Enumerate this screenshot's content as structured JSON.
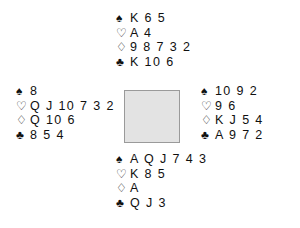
{
  "diagram": {
    "type": "bridge-hand-diagram",
    "suit_symbols": {
      "spade": "♠",
      "heart": "♡",
      "diamond": "♢",
      "club": "♣"
    },
    "colors": {
      "text": "#101010",
      "center_fill": "#e3e3e3",
      "center_border": "#9a9a9a",
      "background": "#ffffff"
    },
    "center": {
      "label": ""
    },
    "hands": {
      "north": {
        "spades": "K 6 5",
        "hearts": "A 4",
        "diamonds": "9 8 7 3 2",
        "clubs": "K 10 6"
      },
      "west": {
        "spades": "8",
        "hearts": "Q J 10 7 3 2",
        "diamonds": "Q 10 6",
        "clubs": "8 5 4"
      },
      "east": {
        "spades": "10 9 2",
        "hearts": "9 6",
        "diamonds": "K J 5 4",
        "clubs": "A 9 7 2"
      },
      "south": {
        "spades": "A Q J 7 4 3",
        "hearts": "K 8 5",
        "diamonds": "A",
        "clubs": "Q J 3"
      }
    }
  }
}
